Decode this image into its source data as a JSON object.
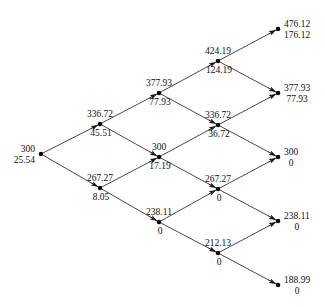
{
  "figure": {
    "type": "binomial-lattice",
    "steps": 4,
    "node_radius": 2.3,
    "line_color": "#1a1a1a",
    "node_color": "#000000",
    "background": "#ffffff"
  },
  "chart_data": {
    "type": "diagram",
    "title": "",
    "xlabel": "",
    "ylabel": "",
    "columns_x": [
      41,
      100,
      159,
      218,
      278
    ],
    "nodes": [
      {
        "id": "n0_0",
        "step": 0,
        "level": 0,
        "x": 41,
        "y": 154,
        "asset": "300",
        "option": "25.54",
        "label_pos": "left"
      },
      {
        "id": "n1_0",
        "step": 1,
        "level": 0,
        "x": 100,
        "y": 124,
        "asset": "336.72",
        "option": "45.51",
        "label_pos": "split"
      },
      {
        "id": "n1_1",
        "step": 1,
        "level": 1,
        "x": 100,
        "y": 188,
        "asset": "267.27",
        "option": "8.05",
        "label_pos": "split"
      },
      {
        "id": "n2_0",
        "step": 2,
        "level": 0,
        "x": 159,
        "y": 93,
        "asset": "377.93",
        "option": "77.93",
        "label_pos": "split"
      },
      {
        "id": "n2_1",
        "step": 2,
        "level": 1,
        "x": 159,
        "y": 157,
        "asset": "300",
        "option": "17.19",
        "label_pos": "split"
      },
      {
        "id": "n2_2",
        "step": 2,
        "level": 2,
        "x": 159,
        "y": 222,
        "asset": "238.11",
        "option": "0",
        "label_pos": "split"
      },
      {
        "id": "n3_0",
        "step": 3,
        "level": 0,
        "x": 218,
        "y": 61,
        "asset": "424.19",
        "option": "124.19",
        "label_pos": "split"
      },
      {
        "id": "n3_1",
        "step": 3,
        "level": 1,
        "x": 218,
        "y": 125,
        "asset": "336.72",
        "option": "36.72",
        "label_pos": "split"
      },
      {
        "id": "n3_2",
        "step": 3,
        "level": 2,
        "x": 218,
        "y": 189,
        "asset": "267.27",
        "option": "0",
        "label_pos": "split"
      },
      {
        "id": "n3_3",
        "step": 3,
        "level": 3,
        "x": 218,
        "y": 253,
        "asset": "212.13",
        "option": "0",
        "label_pos": "split"
      },
      {
        "id": "n4_0",
        "step": 4,
        "level": 0,
        "x": 278,
        "y": 29,
        "asset": "476.12",
        "option": "176.12",
        "label_pos": "right"
      },
      {
        "id": "n4_1",
        "step": 4,
        "level": 1,
        "x": 278,
        "y": 93,
        "asset": "377.93",
        "option": "77.93",
        "label_pos": "right"
      },
      {
        "id": "n4_2",
        "step": 4,
        "level": 2,
        "x": 278,
        "y": 157,
        "asset": "300",
        "option": "0",
        "label_pos": "right"
      },
      {
        "id": "n4_3",
        "step": 4,
        "level": 3,
        "x": 278,
        "y": 221,
        "asset": "238.11",
        "option": "0",
        "label_pos": "right"
      },
      {
        "id": "n4_4",
        "step": 4,
        "level": 4,
        "x": 278,
        "y": 285,
        "asset": "188.99",
        "option": "0",
        "label_pos": "right"
      }
    ],
    "edges": [
      {
        "from": "n0_0",
        "to": "n1_0",
        "direction": "up"
      },
      {
        "from": "n0_0",
        "to": "n1_1",
        "direction": "down"
      },
      {
        "from": "n1_0",
        "to": "n2_0",
        "direction": "up"
      },
      {
        "from": "n1_0",
        "to": "n2_1",
        "direction": "down"
      },
      {
        "from": "n1_1",
        "to": "n2_1",
        "direction": "up"
      },
      {
        "from": "n1_1",
        "to": "n2_2",
        "direction": "down"
      },
      {
        "from": "n2_0",
        "to": "n3_0",
        "direction": "up"
      },
      {
        "from": "n2_0",
        "to": "n3_1",
        "direction": "down"
      },
      {
        "from": "n2_1",
        "to": "n3_1",
        "direction": "up"
      },
      {
        "from": "n2_1",
        "to": "n3_2",
        "direction": "down"
      },
      {
        "from": "n2_2",
        "to": "n3_2",
        "direction": "up"
      },
      {
        "from": "n2_2",
        "to": "n3_3",
        "direction": "down"
      },
      {
        "from": "n3_0",
        "to": "n4_0",
        "direction": "up"
      },
      {
        "from": "n3_0",
        "to": "n4_1",
        "direction": "down"
      },
      {
        "from": "n3_1",
        "to": "n4_1",
        "direction": "up"
      },
      {
        "from": "n3_1",
        "to": "n4_2",
        "direction": "down"
      },
      {
        "from": "n3_2",
        "to": "n4_2",
        "direction": "up"
      },
      {
        "from": "n3_2",
        "to": "n4_3",
        "direction": "down"
      },
      {
        "from": "n3_3",
        "to": "n4_3",
        "direction": "up"
      },
      {
        "from": "n3_3",
        "to": "n4_4",
        "direction": "down"
      }
    ]
  }
}
